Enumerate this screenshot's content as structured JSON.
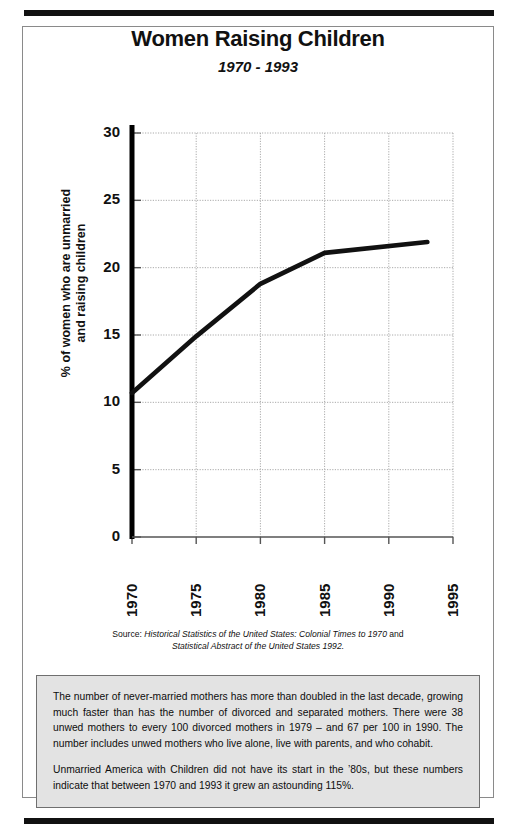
{
  "document": {
    "title": "Women Raising Children",
    "subtitle": "1970 - 1993",
    "source_line1_prefix": "Source: ",
    "source_line1_italic": "Historical Statistics of the United States: Colonial Times to 1970",
    "source_line1_suffix": " and",
    "source_line2_italic": "Statistical Abstract of the United States 1992.",
    "note_paragraph_1": "The number of never-married mothers has more than doubled in the last decade, growing much faster than has the number of divorced and separated mothers. There were 38 unwed mothers to every 100 divorced mothers in 1979 – and 67 per 100 in 1990. The number includes unwed mothers who live alone, live with parents, and who cohabit.",
    "note_paragraph_2": "Unmarried America with Children did not have its start in the ’80s, but these numbers indicate that between 1970 and 1993 it grew an astounding 115%."
  },
  "chart_data": {
    "type": "line",
    "title": "Women Raising Children",
    "subtitle": "1970 - 1993",
    "xlabel": "",
    "ylabel": "% of women who are unmarried and raising children",
    "ylabel_line1": "% of women who are unmarried",
    "ylabel_line2": "and raising children",
    "x": [
      1970,
      1975,
      1980,
      1985,
      1993
    ],
    "values": [
      10.7,
      14.9,
      18.8,
      21.1,
      21.9
    ],
    "series": [
      {
        "name": "% of women who are unmarried and raising children",
        "points": [
          {
            "x": 1970,
            "y": 10.7
          },
          {
            "x": 1975,
            "y": 14.9
          },
          {
            "x": 1980,
            "y": 18.8
          },
          {
            "x": 1985,
            "y": 21.1
          },
          {
            "x": 1993,
            "y": 21.9
          }
        ]
      }
    ],
    "xlim": [
      1970,
      1995
    ],
    "ylim": [
      0,
      30
    ],
    "xticks": [
      1970,
      1975,
      1980,
      1985,
      1990,
      1995
    ],
    "yticks": [
      0,
      5,
      10,
      15,
      20,
      25,
      30
    ],
    "xtick_labels": [
      "1970",
      "1975",
      "1980",
      "1985",
      "1990",
      "1995"
    ],
    "ytick_labels": [
      "0",
      "5",
      "10",
      "15",
      "20",
      "25",
      "30"
    ],
    "grid": true,
    "legend": "none",
    "line_color": "#111111",
    "grid_color": "#aaaaaa",
    "axis_color": "#000000",
    "background_color": "#ffffff"
  }
}
